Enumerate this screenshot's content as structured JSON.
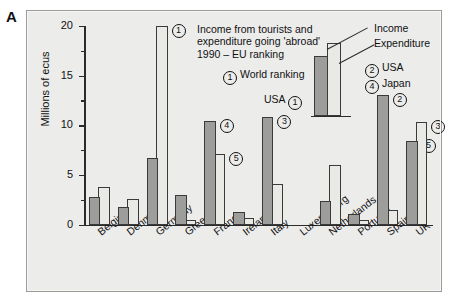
{
  "panel_letter": "A",
  "chart_data": {
    "type": "bar",
    "title_lines": [
      "Income from tourists and",
      "expenditure going 'abroad'",
      "1990 – EU ranking"
    ],
    "xlabel": "",
    "ylabel": "Millions of ecus",
    "ylim": [
      0,
      20
    ],
    "yticks": [
      0,
      5,
      10,
      15,
      20
    ],
    "ytick_labels": [
      "0",
      "5",
      "10",
      "15",
      "20"
    ],
    "yminor_ticks": [
      2.5,
      7.5,
      12.5,
      17.5
    ],
    "grid": false,
    "legend_position": "top-right",
    "categories": [
      "Belgium",
      "Denmark",
      "Germany",
      "Greece",
      "France",
      "Ireland",
      "Italy",
      "Luxembourg",
      "Netherlands",
      "Portugal",
      "Spain",
      "UK"
    ],
    "series": [
      {
        "name": "Income",
        "color": "#9d9d9c",
        "values": [
          2.8,
          1.8,
          6.7,
          3.0,
          10.4,
          1.3,
          10.8,
          0.0,
          2.4,
          1.1,
          13.0,
          8.4
        ]
      },
      {
        "name": "Expenditure",
        "color": "#e9e9e6",
        "values": [
          3.8,
          2.6,
          20.0,
          0.5,
          7.1,
          0.7,
          4.1,
          0.0,
          6.0,
          0.5,
          1.5,
          10.3
        ]
      }
    ],
    "annotations": [
      {
        "category": "Germany",
        "series": "Expenditure",
        "rank": "1"
      },
      {
        "category": "France",
        "series": "Income",
        "rank": "4"
      },
      {
        "category": "France",
        "series": "Expenditure",
        "rank": "5"
      },
      {
        "category": "Italy",
        "series": "Income",
        "rank": "3"
      },
      {
        "category": "Spain",
        "series": "Income",
        "rank": "2"
      },
      {
        "category": "UK",
        "series": "Income",
        "rank": "5"
      },
      {
        "category": "UK",
        "series": "Expenditure",
        "rank": "3"
      }
    ]
  },
  "legend": {
    "income_label": "Income",
    "expenditure_label": "Expenditure",
    "world_ranking_symbol": "1",
    "world_ranking_label": "World ranking",
    "usa_left_label": "USA",
    "usa_left_symbol": "1",
    "rows": [
      {
        "symbol": "2",
        "label": "USA"
      },
      {
        "symbol": "4",
        "label": "Japan"
      }
    ]
  }
}
